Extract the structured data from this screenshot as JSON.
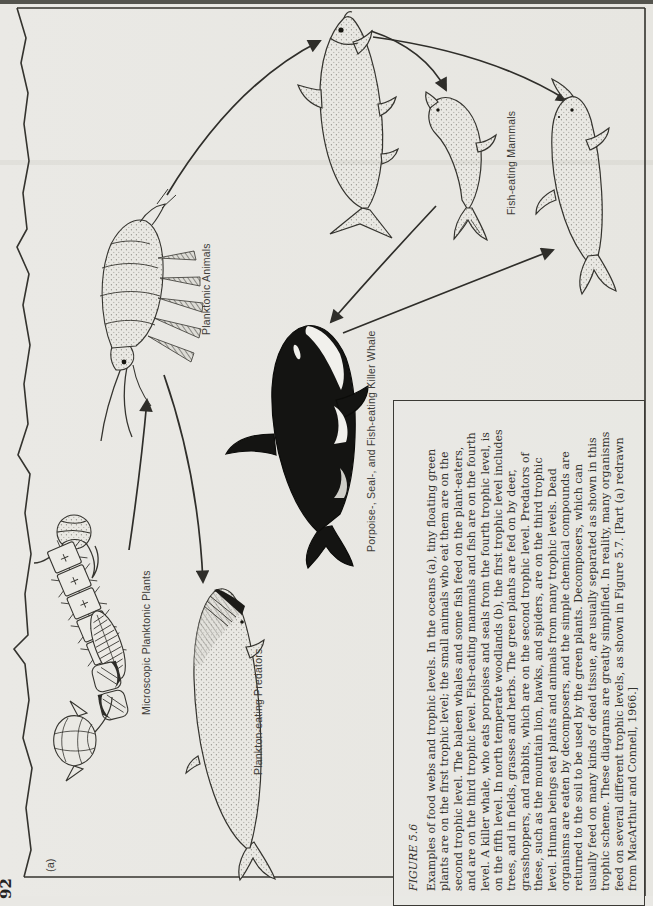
{
  "page": {
    "page_number": "92",
    "panel_label": "(a)"
  },
  "figure": {
    "labels": {
      "planktonic_plants": "Microscopic Planktonic Plants",
      "planktonic_animals": "Planktonic Animals",
      "plankton_eating_predators": "Plankton-eating Predators",
      "fish_eating_mammals": "Fish-eating Mammals",
      "killer_whale": "Porpoise-, Seal-, and Fish-eating Killer Whale"
    },
    "organisms": [
      "microscopic planktonic plants",
      "planktonic animal (copepod)",
      "fish",
      "seal",
      "porpoise",
      "killer whale (orca)",
      "plankton-eating baleen whale"
    ],
    "arrows": [
      {
        "from": "microscopic-planktonic-plants",
        "to": "planktonic-animals"
      },
      {
        "from": "planktonic-animals",
        "to": "plankton-eating-predators"
      },
      {
        "from": "planktonic-animals",
        "to": "fish"
      },
      {
        "from": "fish",
        "to": "seal"
      },
      {
        "from": "fish",
        "to": "porpoise"
      },
      {
        "from": "seal",
        "to": "killer-whale"
      },
      {
        "from": "killer-whale",
        "to": "porpoise"
      }
    ]
  },
  "caption": {
    "heading": "FIGURE 5.6",
    "lines": [
      "Examples of food webs and trophic levels. In the oceans (a), tiny floating green",
      "plants are on the first trophic level; the small animals who eat them are on the",
      "second trophic level. The baleen whales and some fish feed on the plant-eaters,",
      "and are on the third trophic level. Fish-eating mammals and fish are on the fourth",
      "level. A killer whale, who eats porpoises and seals from the fourth trophic level, is",
      "on the fifth level. In north temperate woodlands (b), the first trophic level includes",
      "trees, and in fields, grasses and herbs. The green plants are fed on by deer,",
      "grasshoppers, and rabbits, which are on the second trophic level. Predators of",
      "these, such as the mountain lion, hawks, and spiders, are on the third trophic",
      "level. Human beings eat plants and animals from many trophic levels. Dead",
      "organisms are eaten by decomposers, and the simple chemical compounds are",
      "returned to the soil to be used by the green plants. Decomposers, which can",
      "usually feed on many kinds of dead tissue, are usually separated as shown in this",
      "trophic scheme. These diagrams are greatly simplified. In reality, many organisms",
      "feed on several different trophic levels, as shown in Figure 5.7. [Part (a) redrawn",
      "from MacArthur and Connell, 1966.]"
    ]
  },
  "colors": {
    "paper": "#e9e8e4",
    "ink": "#34332e",
    "orca_black": "#141412"
  }
}
